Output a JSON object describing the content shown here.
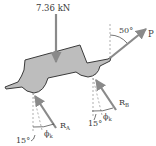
{
  "diagram": {
    "type": "free-body-diagram",
    "colors": {
      "body_fill": "#bdbdbd",
      "body_stroke": "#3a3a3a",
      "force_arrow": "#8a8a8a",
      "dashed_line": "#9a9a9a",
      "text": "#3a3a3a"
    },
    "loads": {
      "weight": {
        "label": "7.36 kN",
        "direction": "down"
      },
      "pull": {
        "label": "P",
        "angle_label": "50°",
        "angle_reference": "vertical"
      }
    },
    "reactions": [
      {
        "id": "A",
        "label": "R",
        "subscript": "A",
        "friction_angle_label": "ϕ",
        "friction_angle_subscript": "k",
        "incline_label": "15°"
      },
      {
        "id": "B",
        "label": "R",
        "subscript": "B",
        "friction_angle_label": "ϕ",
        "friction_angle_subscript": "k",
        "incline_label": "15°"
      }
    ]
  }
}
